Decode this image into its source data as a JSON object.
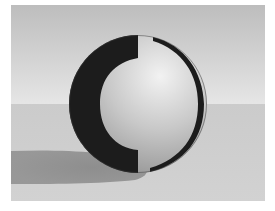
{
  "image": {
    "description": "Rendered 3D sphere on a ground plane with a cast shadow",
    "subject": "sphere",
    "colors": {
      "border": "#ffffff",
      "sky_top": "#bdbdbd",
      "sky_bottom": "#e6e6e6",
      "ground": "#d2d2d2",
      "ground_far": "#cbcbcb",
      "shadow": "#8e8e8e",
      "sphere_light": "#f2f2f2",
      "sphere_mid": "#c8c8c8",
      "sphere_shade": "#8a8a8a",
      "band_dark": "#1c1c1c"
    }
  }
}
